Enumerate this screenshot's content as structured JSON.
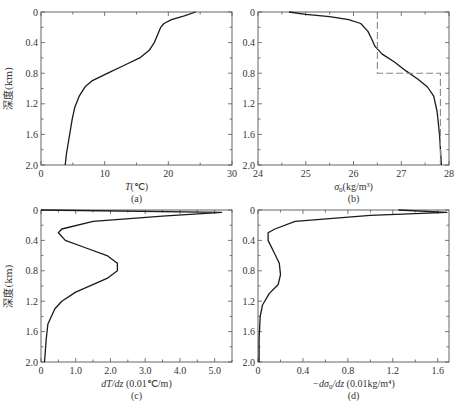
{
  "figure": {
    "shared_ylabel": "深度(km)",
    "panels": [
      {
        "id": "a",
        "caption": "(a)",
        "xlabel_italic": "T",
        "xlabel_rest": "(℃)",
        "yticks": [
          "0",
          "0.4",
          "0.8",
          "1.2",
          "1.6",
          "2.0"
        ],
        "xticks": [
          "0",
          "10",
          "20",
          "30"
        ]
      },
      {
        "id": "b",
        "caption": "(b)",
        "xlabel_italic": "σ",
        "xlabel_sub": "0",
        "xlabel_rest": "(kg/m³)",
        "yticks": [
          "0",
          "0.4",
          "0.8",
          "1.2",
          "1.6",
          "2.0"
        ],
        "xticks": [
          "24",
          "25",
          "26",
          "27",
          "28"
        ]
      },
      {
        "id": "c",
        "caption": "(c)",
        "xlabel_italic": "dT/dz",
        "xlabel_rest": " (0.01℃/m)",
        "yticks": [
          "0",
          "0.4",
          "0.8",
          "1.2",
          "1.6",
          "2.0"
        ],
        "xticks": [
          "0",
          "1.0",
          "2.0",
          "3.0",
          "4.0",
          "5.0"
        ]
      },
      {
        "id": "d",
        "caption": "(d)",
        "xlabel_italic": "−dσ",
        "xlabel_sub": "0",
        "xlabel_italic2": "/dz",
        "xlabel_rest": " (0.01kg/m⁴)",
        "yticks": [
          "0",
          "0.4",
          "0.8",
          "1.2",
          "1.6",
          "2.0"
        ],
        "xticks": [
          "0",
          "0.4",
          "0.8",
          "1.2",
          "1.6"
        ]
      }
    ]
  },
  "chart_data": [
    {
      "type": "line",
      "panel": "(a)",
      "title": "",
      "xlabel": "T (℃)",
      "ylabel": "深度(km)",
      "xlim": [
        0,
        30
      ],
      "ylim": [
        2.0,
        0
      ],
      "y_inverted": true,
      "grid": false,
      "series": [
        {
          "name": "Temperature",
          "x": [
            24.3,
            22.5,
            20.5,
            19.3,
            18.8,
            18.3,
            17.8,
            17.0,
            15.5,
            13.0,
            10.5,
            8.0,
            7.0,
            6.0,
            5.3,
            4.9,
            4.6,
            4.3,
            4.0,
            3.8
          ],
          "depth": [
            0.0,
            0.05,
            0.1,
            0.15,
            0.2,
            0.3,
            0.4,
            0.5,
            0.6,
            0.7,
            0.8,
            0.9,
            0.97,
            1.1,
            1.25,
            1.4,
            1.55,
            1.7,
            1.85,
            2.0
          ]
        }
      ]
    },
    {
      "type": "line",
      "panel": "(b)",
      "title": "",
      "xlabel": "σ0 (kg/m³)",
      "ylabel": "深度(km)",
      "xlim": [
        24,
        28
      ],
      "ylim": [
        2.0,
        0
      ],
      "y_inverted": true,
      "grid": false,
      "series": [
        {
          "name": "Potential density",
          "x": [
            24.65,
            25.0,
            25.5,
            25.9,
            26.15,
            26.3,
            26.38,
            26.45,
            26.6,
            26.85,
            27.1,
            27.35,
            27.55,
            27.68,
            27.75,
            27.8,
            27.84
          ],
          "depth": [
            0.0,
            0.03,
            0.06,
            0.1,
            0.15,
            0.25,
            0.35,
            0.45,
            0.55,
            0.65,
            0.77,
            0.88,
            0.98,
            1.1,
            1.3,
            1.6,
            2.0
          ]
        },
        {
          "name": "Two-layer reference (dashed)",
          "style": "dashed",
          "x": [
            26.5,
            26.5,
            27.82,
            27.82
          ],
          "depth": [
            0.0,
            0.8,
            0.8,
            2.0
          ]
        }
      ]
    },
    {
      "type": "line",
      "panel": "(c)",
      "title": "",
      "xlabel": "dT/dz (0.01℃/m)",
      "ylabel": "深度(km)",
      "xlim": [
        0,
        5.5
      ],
      "ylim": [
        2.0,
        0
      ],
      "y_inverted": true,
      "grid": false,
      "series": [
        {
          "name": "Temperature gradient",
          "x": [
            0.0,
            5.2,
            3.5,
            1.5,
            0.6,
            0.5,
            0.7,
            1.3,
            1.9,
            2.2,
            2.2,
            1.9,
            1.0,
            0.6,
            0.4,
            0.2,
            0.15,
            0.1
          ],
          "depth": [
            0.0,
            0.03,
            0.08,
            0.15,
            0.25,
            0.3,
            0.4,
            0.5,
            0.6,
            0.7,
            0.8,
            0.9,
            1.08,
            1.2,
            1.3,
            1.5,
            1.7,
            2.0
          ]
        }
      ]
    },
    {
      "type": "line",
      "panel": "(d)",
      "title": "",
      "xlabel": "−dσ0/dz (0.01kg/m⁴)",
      "ylabel": "",
      "xlim": [
        0,
        1.7
      ],
      "ylim": [
        2.0,
        0
      ],
      "y_inverted": true,
      "grid": false,
      "series": [
        {
          "name": "Density gradient",
          "x": [
            1.25,
            1.68,
            1.0,
            0.33,
            0.15,
            0.09,
            0.09,
            0.14,
            0.19,
            0.2,
            0.18,
            0.1,
            0.04,
            0.02,
            0.01,
            0.01
          ],
          "depth": [
            0.0,
            0.03,
            0.07,
            0.15,
            0.25,
            0.3,
            0.4,
            0.55,
            0.7,
            0.85,
            0.98,
            1.1,
            1.25,
            1.4,
            1.7,
            2.0
          ]
        }
      ]
    }
  ]
}
